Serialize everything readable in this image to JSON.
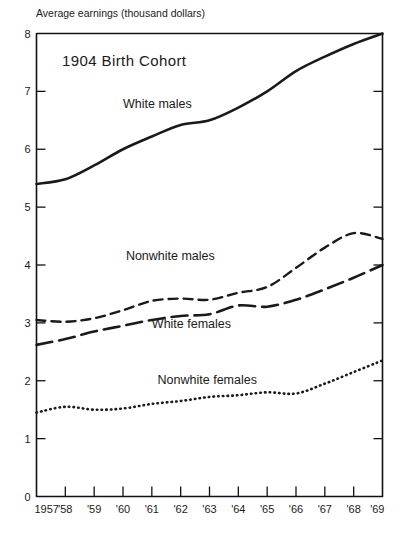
{
  "figure": {
    "title": "1904 Birth Cohort",
    "y_axis_caption": "Average earnings (thousand dollars)"
  },
  "chart_data": {
    "type": "line",
    "title": "1904 Birth Cohort",
    "ylabel": "Average earnings (thousand dollars)",
    "xlabel": "",
    "ylim": [
      0,
      8
    ],
    "xlim": [
      1957,
      1969
    ],
    "grid": false,
    "legend": "inline-labels",
    "ytick_labels": [
      "0",
      "1",
      "2",
      "3",
      "4",
      "5",
      "6",
      "7",
      "8"
    ],
    "ytick_values": [
      0,
      1,
      2,
      3,
      4,
      5,
      6,
      7,
      8
    ],
    "categories": [
      1957,
      1958,
      1959,
      1960,
      1961,
      1962,
      1963,
      1964,
      1965,
      1966,
      1967,
      1968,
      1969
    ],
    "xtick_labels": [
      "1957",
      "'58",
      "'59",
      "'60",
      "'61",
      "'62",
      "'63",
      "'64",
      "'65",
      "'66",
      "'67",
      "'68",
      "'69"
    ],
    "series": [
      {
        "name": "White males",
        "style": "solid",
        "label_x": 1960.0,
        "label_y": 6.72,
        "values": [
          5.4,
          5.48,
          5.72,
          6.0,
          6.22,
          6.42,
          6.5,
          6.72,
          7.0,
          7.35,
          7.6,
          7.82,
          8.0
        ]
      },
      {
        "name": "Nonwhite males",
        "style": "dashed",
        "label_x": 1960.1,
        "label_y": 4.08,
        "values": [
          3.05,
          3.02,
          3.08,
          3.22,
          3.38,
          3.42,
          3.4,
          3.52,
          3.62,
          3.95,
          4.3,
          4.55,
          4.45
        ]
      },
      {
        "name": "White females",
        "style": "long-dashed",
        "label_x": 1961.0,
        "label_y": 2.92,
        "values": [
          2.62,
          2.72,
          2.85,
          2.95,
          3.05,
          3.12,
          3.15,
          3.3,
          3.28,
          3.4,
          3.58,
          3.78,
          4.0
        ]
      },
      {
        "name": "Nonwhite females",
        "style": "dotted",
        "label_x": 1961.2,
        "label_y": 1.95,
        "values": [
          1.45,
          1.55,
          1.5,
          1.52,
          1.6,
          1.65,
          1.72,
          1.75,
          1.8,
          1.78,
          1.95,
          2.15,
          2.35
        ]
      }
    ]
  }
}
